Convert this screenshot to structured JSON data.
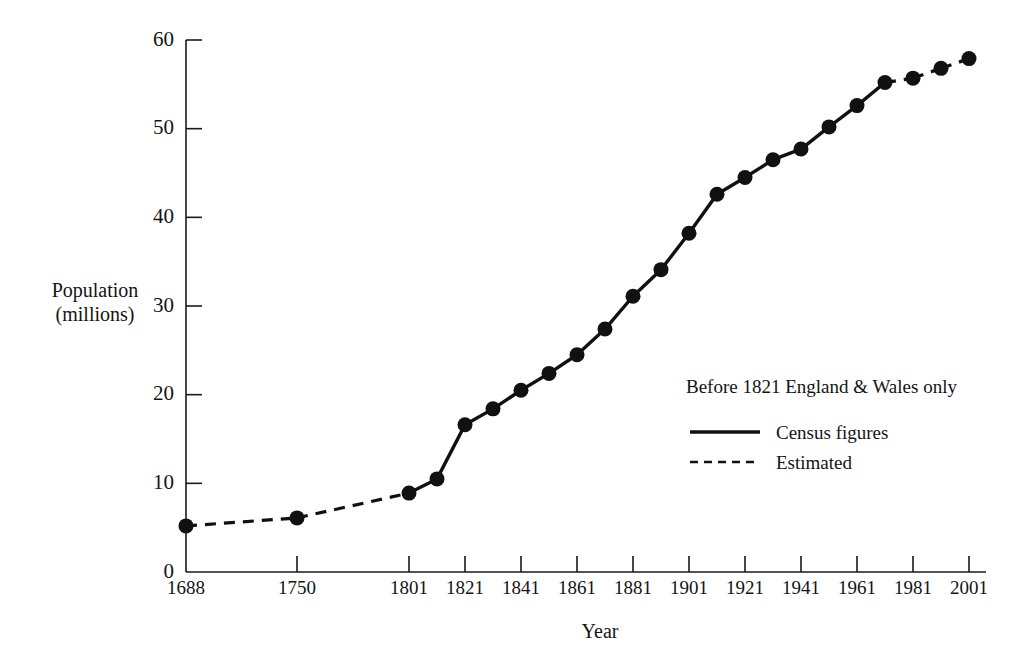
{
  "chart_data": {
    "type": "line",
    "title": "",
    "xlabel": "Year",
    "ylabel": "Population (millions)",
    "ylabel_lines": [
      "Population",
      "(millions)"
    ],
    "xlim": [
      1688,
      2001
    ],
    "ylim": [
      0,
      60
    ],
    "grid": false,
    "y_ticks": [
      0,
      10,
      20,
      30,
      40,
      50,
      60
    ],
    "y_tick_labels": [
      "0",
      "10",
      "20",
      "30",
      "40",
      "50",
      "60"
    ],
    "x_ticks": [
      1688,
      1750,
      1801,
      1821,
      1841,
      1861,
      1881,
      1901,
      1921,
      1941,
      1961,
      1981,
      2001
    ],
    "x_tick_labels": [
      "1688",
      "1750",
      "1801",
      "1821",
      "1841",
      "1861",
      "1881",
      "1901",
      "1921",
      "1941",
      "1961",
      "1981",
      "2001"
    ],
    "annotation": "Before 1821 England & Wales only",
    "legend_position": "lower-right",
    "legend": [
      {
        "label": "Census figures",
        "style": "solid",
        "icon": "solid-line-swatch"
      },
      {
        "label": "Estimated",
        "style": "dashed",
        "icon": "dashed-line-swatch"
      }
    ],
    "series": [
      {
        "name": "Population of Great Britain / England & Wales",
        "x": [
          1688,
          1750,
          1801,
          1811,
          1821,
          1831,
          1841,
          1851,
          1861,
          1871,
          1881,
          1891,
          1901,
          1911,
          1921,
          1931,
          1941,
          1951,
          1961,
          1971,
          1981,
          1991,
          2001
        ],
        "values": [
          5.2,
          6.1,
          8.9,
          10.5,
          16.6,
          18.4,
          20.5,
          22.4,
          24.5,
          27.4,
          31.1,
          34.1,
          38.2,
          42.6,
          44.5,
          46.5,
          47.7,
          50.2,
          52.6,
          55.2,
          55.7,
          56.8,
          57.9
        ],
        "segment_styles": [
          "dashed",
          "dashed",
          "solid",
          "solid",
          "solid",
          "solid",
          "solid",
          "solid",
          "solid",
          "solid",
          "solid",
          "solid",
          "solid",
          "solid",
          "solid",
          "solid",
          "solid",
          "solid",
          "solid",
          "dashed",
          "dashed",
          "dashed"
        ]
      }
    ]
  }
}
